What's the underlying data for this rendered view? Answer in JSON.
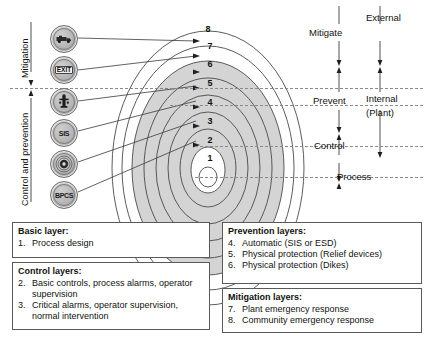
{
  "diagram": {
    "ring_numbers": [
      "1",
      "2",
      "3",
      "4",
      "5",
      "6",
      "7",
      "8"
    ],
    "side_labels": {
      "mitigation": "Mitigation",
      "control_and_prevention": "Control and prevention"
    },
    "zone_labels": {
      "mitigate": "Mitigate",
      "prevent": "Prevent",
      "control": "Control",
      "process": "Process",
      "external": "External",
      "internal": "Internal",
      "internal_sub": "(Plant)"
    },
    "icons": [
      {
        "name": "fire-truck-icon",
        "label": ""
      },
      {
        "name": "exit-sign-icon",
        "label": "EXIT"
      },
      {
        "name": "fire-hydrant-icon",
        "label": ""
      },
      {
        "name": "sis-icon",
        "label": "SIS"
      },
      {
        "name": "alarm-siren-icon",
        "label": ""
      },
      {
        "name": "bpcs-icon",
        "label": "BPCS"
      }
    ],
    "colors": {
      "shaded_ring_fill": "#d4d4d4",
      "ring_stroke": "#4a4a4a",
      "dashed_line": "#8a8a8a",
      "box_border": "#5a5a5a",
      "text": "#111111"
    }
  },
  "legend": {
    "basic": {
      "header": "Basic layer:",
      "items": [
        {
          "num": "1.",
          "text": "Process design"
        }
      ]
    },
    "control": {
      "header": "Control layers:",
      "items": [
        {
          "num": "2.",
          "text": "Basic controls, process alarms, operator supervision"
        },
        {
          "num": "3.",
          "text": "Critical alarms, operator supervision, normal intervention"
        }
      ]
    },
    "prevention": {
      "header": "Prevention layers:",
      "items": [
        {
          "num": "4.",
          "text": "Automatic (SIS or ESD)"
        },
        {
          "num": "5.",
          "text": "Physical protection (Relief devices)"
        },
        {
          "num": "6.",
          "text": "Physical protection (Dikes)"
        }
      ]
    },
    "mitigation": {
      "header": "Mitigation layers:",
      "items": [
        {
          "num": "7.",
          "text": "Plant emergency response"
        },
        {
          "num": "8.",
          "text": "Community emergency response"
        }
      ]
    }
  }
}
